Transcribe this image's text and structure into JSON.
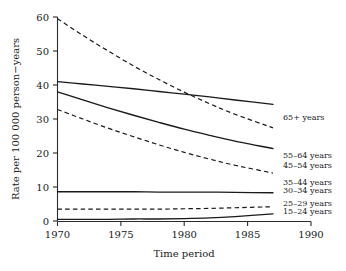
{
  "chart_data": {
    "type": "line",
    "title": "",
    "xlabel": "Time period",
    "ylabel": "Rate per 100 000 person−years",
    "xlim": [
      1970,
      1990
    ],
    "ylim": [
      0,
      60
    ],
    "xticks": [
      1970,
      1975,
      1980,
      1985,
      1990
    ],
    "xticklabels": [
      "1970",
      "1975",
      "1980",
      "1985",
      "1990"
    ],
    "yticks": [
      0,
      10,
      20,
      30,
      40,
      50,
      60
    ],
    "yticklabels": [
      "0",
      "10",
      "20",
      "30",
      "40",
      "50",
      "60"
    ],
    "grid": false,
    "legend_position": "right-of-lines",
    "x": [
      1970,
      1972,
      1974,
      1976,
      1978,
      1980,
      1982,
      1984,
      1987
    ],
    "series": [
      {
        "name": "65+ years",
        "label": "65+ years",
        "style": "solid",
        "values": [
          41.0,
          40.3,
          39.6,
          38.9,
          38.1,
          37.3,
          36.5,
          35.6,
          34.3
        ]
      },
      {
        "name": "55–64 years",
        "label": "55–64 years",
        "style": "dashed",
        "values": [
          59.5,
          54.6,
          50.0,
          45.6,
          41.6,
          37.9,
          34.5,
          31.4,
          27.4
        ]
      },
      {
        "name": "45–54 years",
        "label": "45–54 years",
        "style": "solid",
        "values": [
          38.0,
          35.6,
          33.3,
          31.1,
          29.0,
          27.0,
          25.2,
          23.5,
          21.3
        ]
      },
      {
        "name": "35–44 years",
        "label": "35–44 years",
        "style": "dashed",
        "values": [
          32.8,
          30.0,
          27.3,
          24.8,
          22.4,
          20.2,
          18.2,
          16.4,
          14.1
        ]
      },
      {
        "name": "30–34 years",
        "label": "30–34 years",
        "style": "solid",
        "values": [
          8.6,
          8.6,
          8.6,
          8.6,
          8.5,
          8.5,
          8.5,
          8.4,
          8.3
        ]
      },
      {
        "name": "25–29 years",
        "label": "25–29 years",
        "style": "dashed",
        "values": [
          3.5,
          3.5,
          3.5,
          3.5,
          3.5,
          3.6,
          3.7,
          3.9,
          4.2
        ]
      },
      {
        "name": "15–24 years",
        "label": "15–24 years",
        "style": "solid",
        "values": [
          0.5,
          0.5,
          0.5,
          0.6,
          0.6,
          0.7,
          0.9,
          1.3,
          2.1
        ]
      }
    ]
  },
  "labels": {
    "series_65": "65+ years",
    "series_5564": "55–64 years",
    "series_4554": "45–54 years",
    "series_3544": "35–44 years",
    "series_3034": "30–34 years",
    "series_2529": "25–29 years",
    "series_1524": "15–24 years",
    "xaxis_title": "Time period",
    "yaxis_title": "Rate per 100 000 person−years",
    "xtick_1970": "1970",
    "xtick_1975": "1975",
    "xtick_1980": "1980",
    "xtick_1985": "1985",
    "xtick_1990": "1990",
    "ytick_0": "0",
    "ytick_10": "10",
    "ytick_20": "20",
    "ytick_30": "30",
    "ytick_40": "40",
    "ytick_50": "50",
    "ytick_60": "60"
  }
}
